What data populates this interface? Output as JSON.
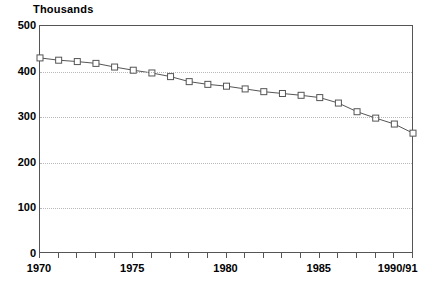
{
  "chart_data": {
    "type": "line",
    "title": "Thousands",
    "xlabel": "",
    "ylabel": "",
    "ylim": [
      0,
      500
    ],
    "yticks": [
      0,
      100,
      200,
      300,
      400,
      500
    ],
    "ytick_labels": [
      "0",
      "100",
      "200",
      "300",
      "400",
      "500"
    ],
    "grid": true,
    "legend": "none",
    "marker": "open-square",
    "x": [
      "1970",
      "1971",
      "1972",
      "1973",
      "1974",
      "1975",
      "1976",
      "1977",
      "1978",
      "1979",
      "1980",
      "1981",
      "1982",
      "1983",
      "1984",
      "1985",
      "1986",
      "1987",
      "1988",
      "1989",
      "1990/91"
    ],
    "xtick_labels": [
      "1970",
      "1975",
      "1980",
      "1985",
      "1990/91"
    ],
    "xtick_label_indices": [
      0,
      5,
      10,
      15,
      20
    ],
    "values": [
      430,
      425,
      422,
      418,
      410,
      403,
      397,
      389,
      378,
      372,
      368,
      362,
      356,
      352,
      348,
      343,
      331,
      312,
      298,
      285,
      265
    ],
    "series": [
      {
        "name": "Total",
        "values": [
          430,
          425,
          422,
          418,
          410,
          403,
          397,
          389,
          378,
          372,
          368,
          362,
          356,
          352,
          348,
          343,
          331,
          312,
          298,
          285,
          265
        ]
      }
    ],
    "colors": {
      "line": "#555555",
      "marker": "#555555",
      "grid": "#b8b8b8",
      "axis": "#555555",
      "background": "#ffffff"
    }
  }
}
